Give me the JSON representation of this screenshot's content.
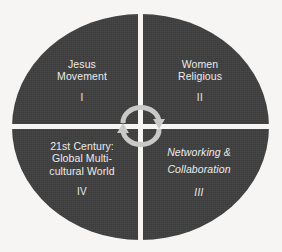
{
  "diagram": {
    "shape": "ellipse",
    "colors": {
      "background": "#f6f5f3",
      "ellipse_fill": "#3f3f3f",
      "divider": "#f6f5f3",
      "text": "#ebebe9",
      "arrow": "#c9c9c7"
    },
    "center_icon": {
      "name": "cyclical-arrows-icon",
      "description": "two semicircular arrows forming a continuous cycle"
    },
    "quadrants": [
      {
        "id": "I",
        "label": "Jesus\nMovement",
        "numeral": "I",
        "position": "top-left",
        "style": "normal"
      },
      {
        "id": "II",
        "label": "Women\nReligious",
        "numeral": "II",
        "position": "top-right",
        "style": "normal"
      },
      {
        "id": "III",
        "label": "Networking &\nCollaboration",
        "numeral": "III",
        "position": "bottom-right",
        "style": "italic"
      },
      {
        "id": "IV",
        "label": "21st Century:\nGlobal Multi-\ncultural World",
        "numeral": "IV",
        "position": "bottom-left",
        "style": "normal"
      }
    ]
  }
}
